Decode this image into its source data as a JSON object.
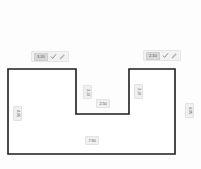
{
  "editor": {
    "name": "room-shape-editor",
    "background_color": "#fdfdfd",
    "outline_color": "#1c1c1c",
    "fill_color": "#ffffff",
    "chip_background": "#f0f0f0",
    "chip_text_color": "#5a5a5a"
  },
  "shape": {
    "name": "u-shaped-room-outline",
    "type": "notched-rectangle",
    "points": "8,69 76,69 76,114 129,114 129,69 175,69 175,154 8,154"
  },
  "edit_chips": [
    {
      "id": "top-left-wall-edit",
      "value": "3.20",
      "confirm_icon": "check-icon",
      "edit_icon": "pencil-icon"
    },
    {
      "id": "top-right-wall-edit",
      "value": "2.10",
      "confirm_icon": "check-icon",
      "edit_icon": "pencil-icon"
    }
  ],
  "dimension_chips": [
    {
      "id": "left-wall-dimension",
      "value": "4.05",
      "orientation": "vertical"
    },
    {
      "id": "right-wall-dimension",
      "value": "4.05",
      "orientation": "vertical"
    },
    {
      "id": "notch-left-wall-dimension",
      "value": "2.10",
      "orientation": "vertical"
    },
    {
      "id": "notch-right-wall-dimension",
      "value": "2.10",
      "orientation": "vertical"
    },
    {
      "id": "notch-bottom-dimension",
      "value": "2.50",
      "orientation": "horizontal"
    },
    {
      "id": "bottom-wall-dimension",
      "value": "7.90",
      "orientation": "horizontal"
    }
  ]
}
